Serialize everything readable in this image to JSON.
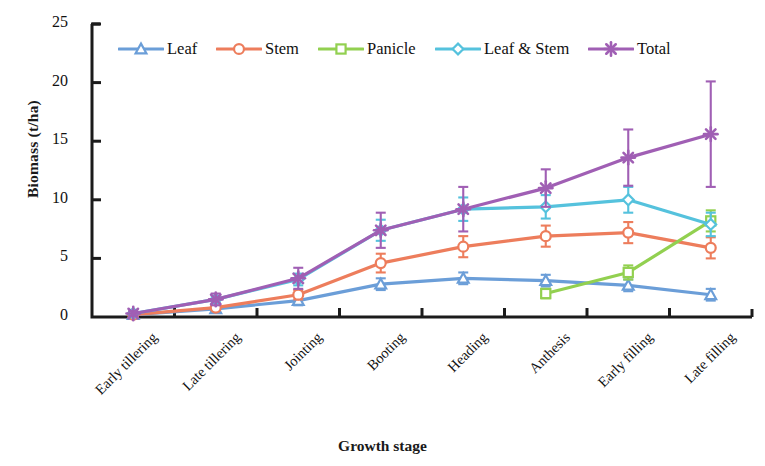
{
  "chart_data": {
    "type": "line",
    "title": "",
    "xlabel": "Growth stage",
    "ylabel": "Biomass (t/ha)",
    "ylim": [
      0,
      25
    ],
    "yticks": [
      0,
      5,
      10,
      15,
      20,
      25
    ],
    "grid": false,
    "legend_position": "top-inside",
    "categories": [
      "Early tillering",
      "Late tillering",
      "Jointing",
      "Booting",
      "Heading",
      "Anthesis",
      "Early filling",
      "Late filling"
    ],
    "series": [
      {
        "name": "Leaf",
        "color": "#6b9ed8",
        "marker": "triangle",
        "values": [
          0.2,
          0.7,
          1.4,
          2.8,
          3.3,
          3.1,
          2.7,
          1.9
        ],
        "errors": [
          0.1,
          0.2,
          0.4,
          0.5,
          0.5,
          0.5,
          0.5,
          0.5
        ]
      },
      {
        "name": "Stem",
        "color": "#ed7d5c",
        "marker": "circle",
        "values": [
          0.2,
          0.8,
          1.9,
          4.6,
          6.0,
          6.9,
          7.2,
          5.9
        ],
        "errors": [
          0.1,
          0.2,
          0.4,
          0.8,
          0.9,
          0.9,
          0.9,
          0.9
        ]
      },
      {
        "name": "Panicle",
        "color": "#92d050",
        "marker": "square",
        "values": [
          null,
          null,
          null,
          null,
          null,
          2.0,
          3.8,
          8.2
        ],
        "errors": [
          null,
          null,
          null,
          null,
          null,
          0.4,
          0.6,
          0.9
        ]
      },
      {
        "name": "Leaf & Stem",
        "color": "#55c2dd",
        "marker": "diamond",
        "values": [
          0.3,
          1.5,
          3.2,
          7.4,
          9.2,
          9.4,
          10.0,
          7.9
        ],
        "errors": [
          0.1,
          0.3,
          0.5,
          0.9,
          1.0,
          1.0,
          1.1,
          1.0
        ]
      },
      {
        "name": "Total",
        "color": "#a05fb4",
        "marker": "asterisk",
        "values": [
          0.3,
          1.5,
          3.3,
          7.4,
          9.2,
          11.0,
          13.6,
          15.6
        ],
        "errors": [
          0.2,
          0.5,
          0.9,
          1.5,
          1.9,
          1.6,
          2.4,
          4.5
        ]
      }
    ]
  },
  "axis": {
    "y_tick_labels": [
      "0",
      "5",
      "10",
      "15",
      "20",
      "25"
    ],
    "y_axis_title": "Biomass (t/ha)",
    "x_axis_title": "Growth stage"
  },
  "legend": {
    "items": [
      {
        "label": "Leaf",
        "color": "#6b9ed8",
        "marker": "triangle"
      },
      {
        "label": "Stem",
        "color": "#ed7d5c",
        "marker": "circle"
      },
      {
        "label": "Panicle",
        "color": "#92d050",
        "marker": "square"
      },
      {
        "label": "Leaf & Stem",
        "color": "#55c2dd",
        "marker": "diamond"
      },
      {
        "label": "Total",
        "color": "#a05fb4",
        "marker": "asterisk"
      }
    ]
  }
}
